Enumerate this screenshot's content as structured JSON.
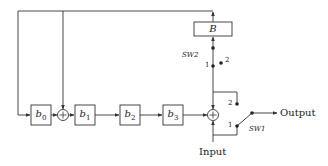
{
  "diagram": {
    "colors": {
      "line": "#333333",
      "background": "#ffffff"
    },
    "blocks": [
      {
        "id": "b0",
        "label": "b0",
        "base": "b",
        "sub": "0"
      },
      {
        "id": "b1",
        "label": "b1",
        "base": "b",
        "sub": "1"
      },
      {
        "id": "b2",
        "label": "b2",
        "base": "b",
        "sub": "2"
      },
      {
        "id": "b3",
        "label": "b3",
        "base": "b",
        "sub": "3"
      },
      {
        "id": "B",
        "label": "B"
      }
    ],
    "adders": [
      {
        "id": "adder-1",
        "symbol": "+"
      },
      {
        "id": "adder-2",
        "symbol": "+"
      }
    ],
    "switches": {
      "sw2": {
        "label": "SW2",
        "pos1": "1",
        "pos2": "2"
      },
      "sw1": {
        "label": "SW1",
        "pos1": "1",
        "pos2": "2"
      }
    },
    "io": {
      "input": "Input",
      "output": "Output"
    }
  }
}
